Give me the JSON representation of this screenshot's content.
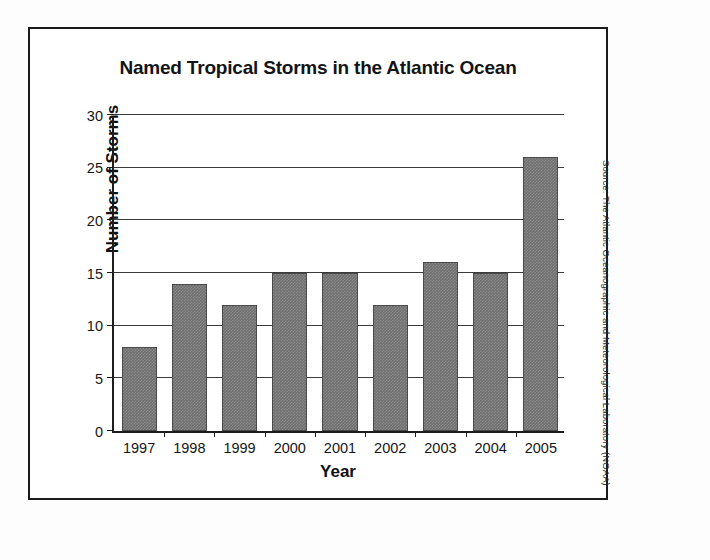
{
  "figure": {
    "source_credit": "Source: The Atlantic Oceanographic and Meteorological Laboratory (NOAA)",
    "frame_color": "#1b1b1b",
    "bar_color": "#6f6f6f"
  },
  "chart_data": {
    "type": "bar",
    "title": "Named Tropical Storms in the Atlantic Ocean",
    "xlabel": "Year",
    "ylabel": "Number of Storms",
    "categories": [
      "1997",
      "1998",
      "1999",
      "2000",
      "2001",
      "2002",
      "2003",
      "2004",
      "2005"
    ],
    "values": [
      8,
      14,
      12,
      15,
      15,
      12,
      16,
      15,
      26
    ],
    "ylim": [
      0,
      30
    ],
    "ytick_labels": [
      "0",
      "5",
      "10",
      "15",
      "20",
      "25",
      "30"
    ],
    "ytick_values": [
      0,
      5,
      10,
      15,
      20,
      25,
      30
    ],
    "grid": "horizontal",
    "legend": "none",
    "series_name": "Named Tropical Storms"
  }
}
